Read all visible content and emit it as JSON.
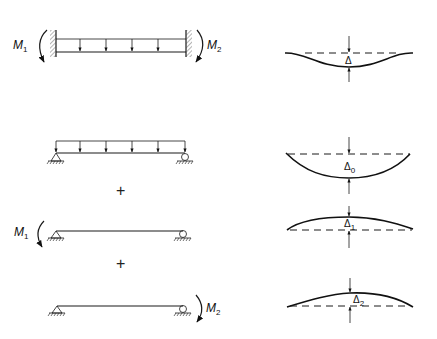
{
  "diagram": {
    "rows": [
      {
        "id": "fixed-beam",
        "beam": "fixed-fixed beam with uniform load",
        "left_moment": {
          "symbol": "M",
          "subscript": "1"
        },
        "right_moment": {
          "symbol": "M",
          "subscript": "2"
        },
        "deflection": {
          "symbol": "Δ",
          "subscript": "",
          "shape": "sag-with-fixed-ends"
        }
      },
      {
        "id": "simple-load",
        "beam": "simply supported beam with uniform load",
        "deflection": {
          "symbol": "Δ",
          "subscript": "0",
          "shape": "sag"
        }
      },
      {
        "id": "simple-m1",
        "beam": "simply supported beam with end moment M1",
        "left_moment": {
          "symbol": "M",
          "subscript": "1"
        },
        "deflection": {
          "symbol": "Δ",
          "subscript": "1",
          "shape": "hog"
        }
      },
      {
        "id": "simple-m2",
        "beam": "simply supported beam with end moment M2",
        "right_moment": {
          "symbol": "M",
          "subscript": "2"
        },
        "deflection": {
          "symbol": "Δ",
          "subscript": "2",
          "shape": "hog"
        }
      }
    ],
    "operators": [
      "+",
      "+"
    ]
  }
}
